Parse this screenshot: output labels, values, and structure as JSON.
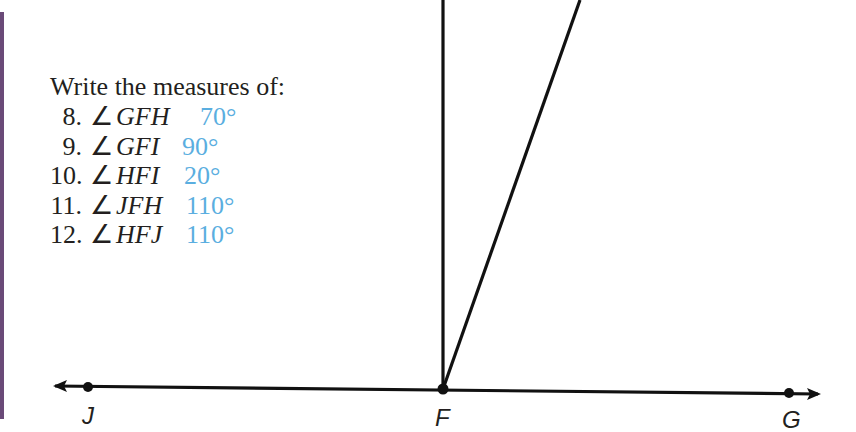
{
  "exercise": {
    "prompt": "Write the measures of:",
    "questions": [
      {
        "number": "8.",
        "angle_symbol": "∠",
        "angle": "GFH",
        "answer": "70°"
      },
      {
        "number": "9.",
        "angle_symbol": "∠",
        "angle": "GFI",
        "answer": "90°"
      },
      {
        "number": "10.",
        "angle_symbol": "∠",
        "angle": "HFI",
        "answer": "20°"
      },
      {
        "number": "11.",
        "angle_symbol": "∠",
        "angle": "JFH",
        "answer": "110°"
      },
      {
        "number": "12.",
        "angle_symbol": "∠",
        "angle": "HFJ",
        "answer": "110°"
      }
    ]
  },
  "figure": {
    "points": [
      {
        "label": "J",
        "x": 88,
        "y": 387
      },
      {
        "label": "F",
        "x": 443,
        "y": 389
      },
      {
        "label": "G",
        "x": 789,
        "y": 393
      }
    ],
    "colors": {
      "answer": "#5aaee0",
      "line": "#111111",
      "side_bar": "#6a4a78"
    }
  }
}
